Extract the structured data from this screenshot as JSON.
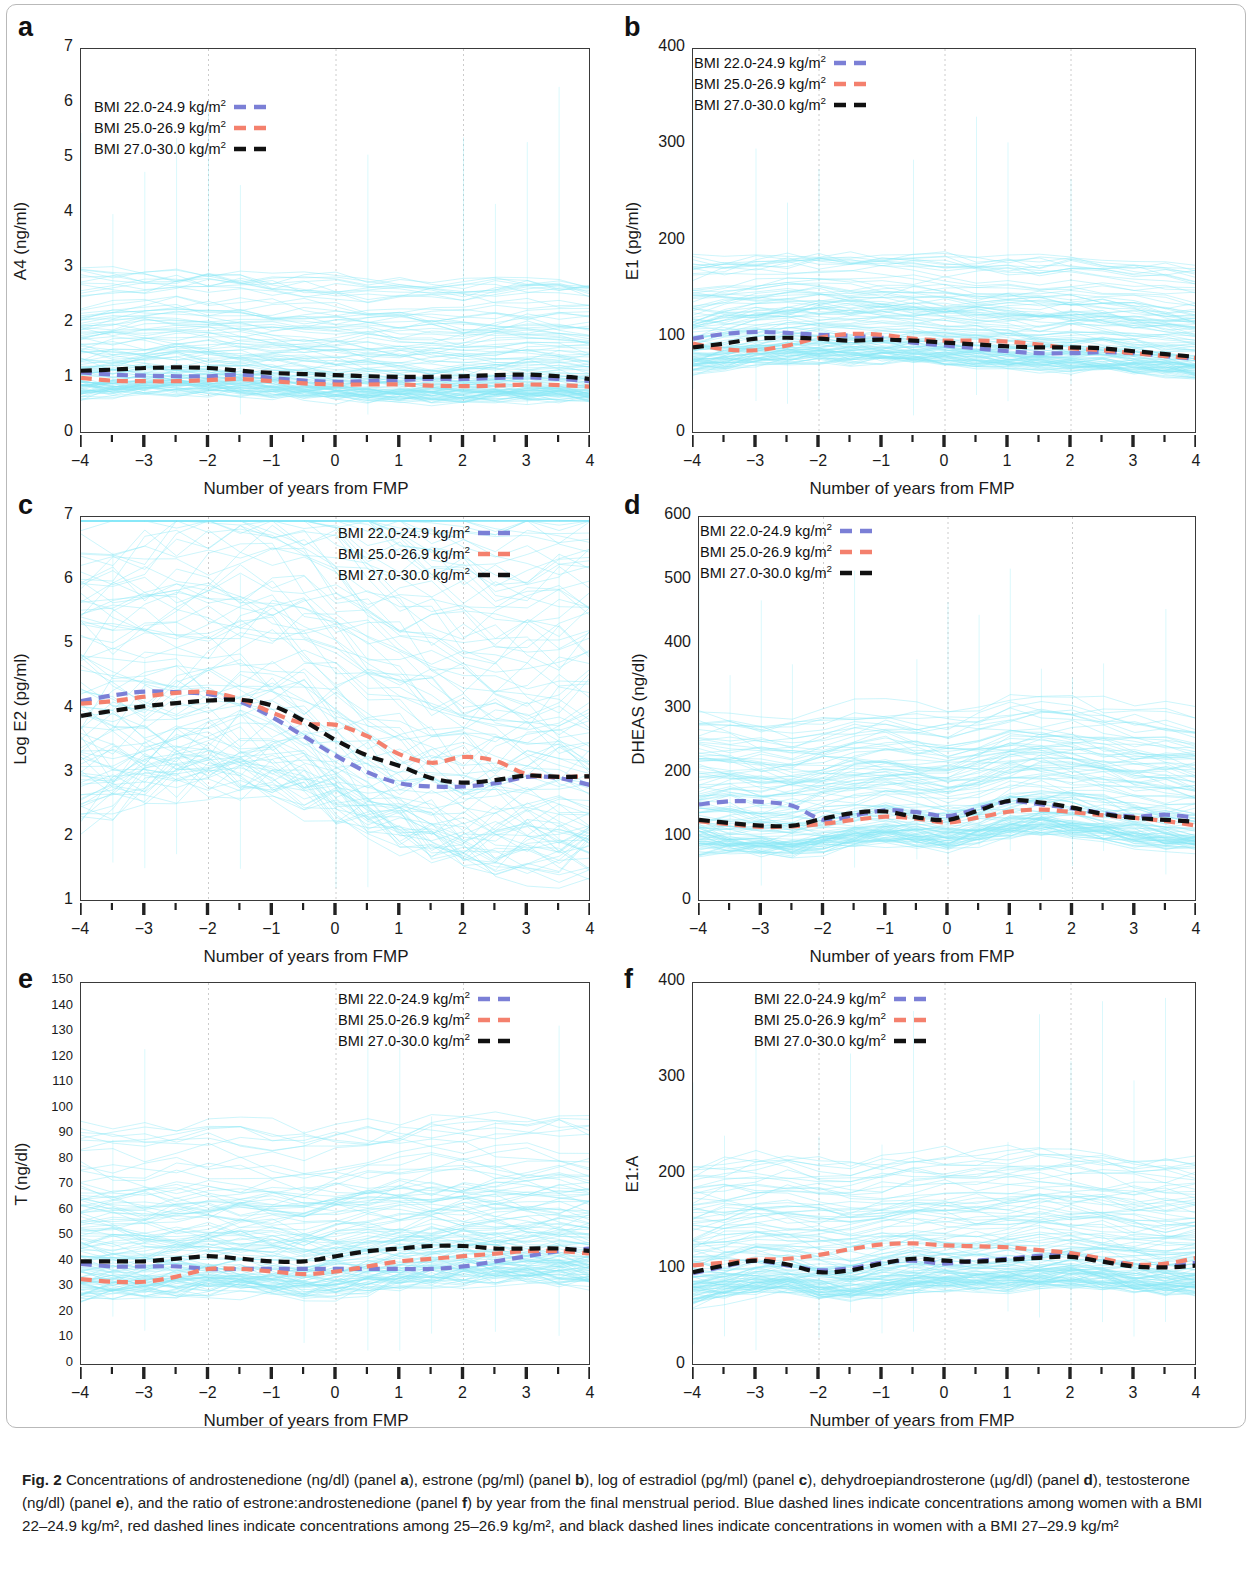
{
  "figure": {
    "label": "Fig. 2",
    "caption_parts": [
      "Concentrations of androstenedione (ng/dl) (panel ",
      "a",
      "), estrone (pg/ml) (panel ",
      "b",
      "), log of estradiol (pg/ml) (panel ",
      "c",
      "), dehydroepiandrosterone (µg/dl) (panel ",
      "d",
      "), testosterone (ng/dl) (panel ",
      "e",
      "), and the ratio of estrone:androstenedione (panel ",
      "f",
      ") by year from the final menstrual period. Blue dashed lines indicate concentrations among women with a BMI 22–24.9 kg/m², red dashed lines indicate concentrations among 25–26.9 kg/m², and black dashed lines indicate concentrations in women with a BMI 27–29.9 kg/m²"
    ],
    "caption_text": "Concentrations of androstenedione (ng/dl) (panel a), estrone (pg/ml) (panel b), log of estradiol (pg/ml) (panel c), dehydroepiandrosterone (µg/dl) (panel d), testosterone (ng/dl) (panel e), and the ratio of estrone:androstenedione (panel f) by year from the final menstrual period. Blue dashed lines indicate concentrations among women with a BMI 22–24.9 kg/m², red dashed lines indicate concentrations among 25–26.9 kg/m², and black dashed lines indicate concentrations in women with a BMI 27–29.9 kg/m²"
  },
  "colors": {
    "blue": "#7b7fd6",
    "red": "#f4806d",
    "black": "#111111",
    "spaghetti": "#8ae8f5",
    "axis": "#3a3a3a",
    "grid": "#cccccc"
  },
  "legend": {
    "blue_label": "BMI 22.0-24.9 kg/m",
    "red_label": "BMI 25.0-26.9 kg/m",
    "black_label": "BMI 27.0-30.0 kg/m",
    "exponent": "2"
  },
  "xaxis": {
    "title": "Number of years from FMP",
    "ticks": [
      "−4",
      "−3",
      "−2",
      "−1",
      "0",
      "1",
      "2",
      "3",
      "4"
    ],
    "min": -4,
    "max": 4
  },
  "chart_data": [
    {
      "panel": "a",
      "type": "line",
      "title": "",
      "ylabel": "A4 (ng/ml)",
      "xlabel": "Number of years from FMP",
      "ylim": [
        0,
        7
      ],
      "yticks": [
        0,
        1,
        2,
        3,
        4,
        5,
        6,
        7
      ],
      "ytick_labels": [
        "0",
        "1",
        "2",
        "3",
        "4",
        "5",
        "6",
        "7"
      ],
      "xlim": [
        -4,
        4
      ],
      "grid": "vertical-dotted",
      "legend_position": "top-left",
      "x": [
        -4,
        -3.5,
        -3,
        -2.5,
        -2,
        -1.5,
        -1,
        -0.5,
        0,
        0.5,
        1,
        1.5,
        2,
        2.5,
        3,
        3.5,
        4
      ],
      "series": [
        {
          "name": "BMI 22.0-24.9 kg/m2",
          "color": "#7b7fd6",
          "values": [
            1.12,
            1.08,
            1.06,
            1.05,
            1.05,
            1.08,
            1.02,
            0.97,
            0.95,
            0.96,
            0.98,
            1.0,
            1.0,
            1.02,
            1.03,
            1.0,
            0.96
          ]
        },
        {
          "name": "BMI 25.0-26.9 kg/m2",
          "color": "#f4806d",
          "values": [
            1.02,
            0.97,
            0.96,
            0.96,
            0.98,
            1.0,
            0.96,
            0.92,
            0.9,
            0.9,
            0.9,
            0.88,
            0.87,
            0.88,
            0.9,
            0.89,
            0.86
          ]
        },
        {
          "name": "BMI 27.0-30.0 kg/m2",
          "color": "#111111",
          "values": [
            1.15,
            1.17,
            1.2,
            1.21,
            1.2,
            1.15,
            1.11,
            1.09,
            1.07,
            1.05,
            1.04,
            1.04,
            1.05,
            1.07,
            1.08,
            1.05,
            1.0
          ]
        }
      ]
    },
    {
      "panel": "b",
      "type": "line",
      "title": "",
      "ylabel": "E1 (pg/ml)",
      "xlabel": "Number of years from FMP",
      "ylim": [
        0,
        400
      ],
      "yticks": [
        0,
        100,
        200,
        300,
        400
      ],
      "ytick_labels": [
        "0",
        "100",
        "200",
        "300",
        "400"
      ],
      "xlim": [
        -4,
        4
      ],
      "grid": "vertical-dotted",
      "legend_position": "top-left",
      "x": [
        -4,
        -3.5,
        -3,
        -2.5,
        -2,
        -1.5,
        -1,
        -0.5,
        0,
        0.5,
        1,
        1.5,
        2,
        2.5,
        3,
        3.5,
        4
      ],
      "series": [
        {
          "name": "BMI 22.0-24.9 kg/m2",
          "color": "#7b7fd6",
          "values": [
            99,
            104,
            106,
            105,
            103,
            102,
            100,
            95,
            92,
            89,
            86,
            84,
            84,
            85,
            84,
            81,
            78
          ]
        },
        {
          "name": "BMI 25.0-26.9 kg/m2",
          "color": "#f4806d",
          "values": [
            94,
            88,
            87,
            92,
            100,
            104,
            103,
            99,
            97,
            97,
            96,
            93,
            89,
            87,
            84,
            81,
            79
          ]
        },
        {
          "name": "BMI 27.0-30.0 kg/m2",
          "color": "#111111",
          "values": [
            90,
            94,
            99,
            100,
            99,
            97,
            98,
            97,
            95,
            93,
            91,
            90,
            90,
            89,
            86,
            83,
            80
          ]
        }
      ]
    },
    {
      "panel": "c",
      "type": "line",
      "title": "",
      "ylabel": "Log E2 (pg/ml)",
      "xlabel": "Number of years from FMP",
      "ylim": [
        1,
        7
      ],
      "yticks": [
        1,
        2,
        3,
        4,
        5,
        6,
        7
      ],
      "ytick_labels": [
        "1",
        "2",
        "3",
        "4",
        "5",
        "6",
        "7"
      ],
      "xlim": [
        -4,
        4
      ],
      "grid": "vertical-dotted",
      "legend_position": "top-right",
      "x": [
        -4,
        -3.5,
        -3,
        -2.5,
        -2,
        -1.5,
        -1,
        -0.5,
        0,
        0.5,
        1,
        1.5,
        2,
        2.5,
        3,
        3.5,
        4
      ],
      "series": [
        {
          "name": "BMI 22.0-24.9 kg/m2",
          "color": "#7b7fd6",
          "values": [
            4.13,
            4.22,
            4.28,
            4.27,
            4.24,
            4.12,
            3.88,
            3.58,
            3.28,
            3.02,
            2.85,
            2.8,
            2.8,
            2.85,
            2.95,
            2.93,
            2.82
          ]
        },
        {
          "name": "BMI 25.0-26.9 kg/m2",
          "color": "#f4806d",
          "values": [
            4.09,
            4.13,
            4.2,
            4.26,
            4.27,
            4.16,
            3.95,
            3.78,
            3.76,
            3.58,
            3.3,
            3.17,
            3.26,
            3.2,
            2.99,
            2.95,
            2.96
          ]
        },
        {
          "name": "BMI 27.0-30.0 kg/m2",
          "color": "#111111",
          "values": [
            3.9,
            3.98,
            4.05,
            4.1,
            4.14,
            4.15,
            4.06,
            3.82,
            3.52,
            3.28,
            3.12,
            2.93,
            2.86,
            2.9,
            2.97,
            2.95,
            2.96
          ]
        }
      ]
    },
    {
      "panel": "d",
      "type": "line",
      "title": "",
      "ylabel": "DHEAS (ng/dl)",
      "xlabel": "Number of years from FMP",
      "ylim": [
        0,
        600
      ],
      "yticks": [
        0,
        100,
        200,
        300,
        400,
        500,
        600
      ],
      "ytick_labels": [
        "0",
        "100",
        "200",
        "300",
        "400",
        "500",
        "600"
      ],
      "xlim": [
        -4,
        4
      ],
      "grid": "vertical-dotted",
      "legend_position": "top-left",
      "x": [
        -4,
        -3.5,
        -3,
        -2.5,
        -2,
        -1.5,
        -1,
        -0.5,
        0,
        0.5,
        1,
        1.5,
        2,
        2.5,
        3,
        3.5,
        4
      ],
      "series": [
        {
          "name": "BMI 22.0-24.9 kg/m2",
          "color": "#7b7fd6",
          "values": [
            152,
            157,
            156,
            150,
            128,
            135,
            143,
            140,
            134,
            146,
            157,
            152,
            146,
            138,
            133,
            136,
            131
          ]
        },
        {
          "name": "BMI 25.0-26.9 kg/m2",
          "color": "#f4806d",
          "values": [
            126,
            121,
            117,
            118,
            122,
            128,
            133,
            130,
            124,
            132,
            141,
            144,
            140,
            135,
            131,
            126,
            119
          ]
        },
        {
          "name": "BMI 27.0-30.0 kg/m2",
          "color": "#111111",
          "values": [
            128,
            123,
            119,
            119,
            130,
            139,
            141,
            132,
            128,
            143,
            158,
            155,
            147,
            137,
            131,
            128,
            125
          ]
        }
      ]
    },
    {
      "panel": "e",
      "type": "line",
      "title": "",
      "ylabel": "T (ng/dl)",
      "xlabel": "Number of years from FMP",
      "ylim": [
        0,
        150
      ],
      "yticks": [
        0,
        10,
        20,
        30,
        40,
        50,
        60,
        70,
        80,
        90,
        100,
        110,
        120,
        130,
        140,
        150
      ],
      "ytick_labels": [
        "0",
        "10",
        "20",
        "30",
        "40",
        "50",
        "60",
        "70",
        "80",
        "90",
        "100",
        "110",
        "120",
        "130",
        "140",
        "150"
      ],
      "xlim": [
        -4,
        4
      ],
      "grid": "vertical-dotted",
      "legend_position": "top-right",
      "x": [
        -4,
        -3.5,
        -3,
        -2.5,
        -2,
        -1.5,
        -1,
        -0.5,
        0,
        0.5,
        1,
        1.5,
        2,
        2.5,
        3,
        3.5,
        4
      ],
      "series": [
        {
          "name": "BMI 22.0-24.9 kg/m2",
          "color": "#7b7fd6",
          "values": [
            40,
            39,
            39,
            39,
            38,
            38,
            38,
            38,
            38,
            38,
            38,
            38,
            39,
            41,
            43,
            45,
            46
          ]
        },
        {
          "name": "BMI 25.0-26.9 kg/m2",
          "color": "#f4806d",
          "values": [
            34,
            33,
            33,
            35,
            38,
            38,
            37,
            36,
            37,
            39,
            41,
            42,
            43,
            44,
            45,
            45,
            44
          ]
        },
        {
          "name": "BMI 27.0-30.0 kg/m2",
          "color": "#111111",
          "values": [
            41,
            41,
            41,
            42,
            43,
            42,
            41,
            41,
            43,
            45,
            46,
            47,
            47,
            46,
            46,
            46,
            45
          ]
        }
      ]
    },
    {
      "panel": "f",
      "type": "line",
      "title": "",
      "ylabel": "E1:A",
      "xlabel": "Number of years from FMP",
      "ylim": [
        0,
        400
      ],
      "yticks": [
        0,
        100,
        200,
        300,
        400
      ],
      "ytick_labels": [
        "0",
        "100",
        "200",
        "300",
        "400"
      ],
      "xlim": [
        -4,
        4
      ],
      "grid": "vertical-dotted",
      "legend_position": "top-center",
      "x": [
        -4,
        -3.5,
        -3,
        -2.5,
        -2,
        -1.5,
        -1,
        -0.5,
        0,
        0.5,
        1,
        1.5,
        2,
        2.5,
        3,
        3.5,
        4
      ],
      "series": [
        {
          "name": "BMI 22.0-24.9 kg/m2",
          "color": "#7b7fd6",
          "values": [
            97,
            104,
            110,
            105,
            100,
            102,
            108,
            110,
            107,
            110,
            112,
            115,
            116,
            110,
            106,
            104,
            108
          ]
        },
        {
          "name": "BMI 25.0-26.9 kg/m2",
          "color": "#f4806d",
          "values": [
            105,
            108,
            111,
            112,
            116,
            122,
            127,
            128,
            126,
            125,
            124,
            121,
            118,
            112,
            106,
            107,
            113
          ]
        },
        {
          "name": "BMI 27.0-30.0 kg/m2",
          "color": "#111111",
          "values": [
            98,
            105,
            110,
            106,
            98,
            100,
            107,
            112,
            110,
            109,
            111,
            113,
            114,
            109,
            104,
            103,
            105
          ]
        }
      ]
    }
  ]
}
